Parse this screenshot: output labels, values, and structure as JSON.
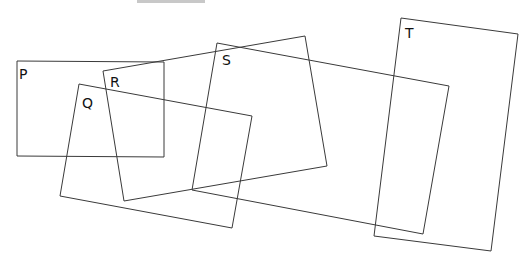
{
  "diagram": {
    "title_partial": "",
    "stroke_color": "#3a3a3a",
    "shapes": [
      {
        "label": "P",
        "points": [
          [
            17,
            61
          ],
          [
            164,
            62
          ],
          [
            164,
            157
          ],
          [
            17,
            156
          ]
        ],
        "label_pos": [
          19,
          79
        ]
      },
      {
        "label": "Q",
        "points": [
          [
            79,
            84
          ],
          [
            252,
            116
          ],
          [
            232,
            228
          ],
          [
            60,
            196
          ]
        ],
        "label_pos": [
          82,
          108
        ]
      },
      {
        "label": "R",
        "points": [
          [
            103,
            71
          ],
          [
            305,
            36
          ],
          [
            327,
            166
          ],
          [
            124,
            201
          ]
        ],
        "label_pos": [
          110,
          87
        ]
      },
      {
        "label": "S",
        "points": [
          [
            217,
            43
          ],
          [
            449,
            86
          ],
          [
            423,
            234
          ],
          [
            192,
            190
          ]
        ],
        "label_pos": [
          222,
          65
        ]
      },
      {
        "label": "T",
        "points": [
          [
            401,
            18
          ],
          [
            518,
            34
          ],
          [
            491,
            251
          ],
          [
            374,
            236
          ]
        ],
        "label_pos": [
          405,
          38
        ]
      }
    ]
  }
}
